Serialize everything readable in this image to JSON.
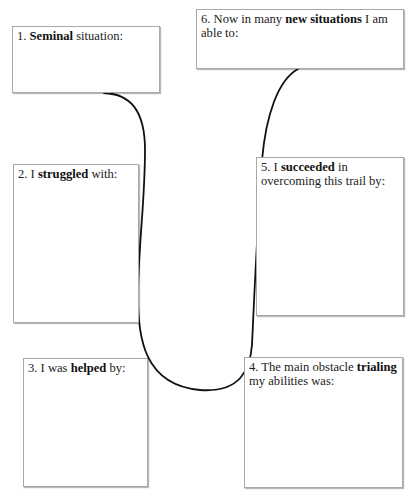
{
  "diagram": {
    "type": "story-arc-worksheet",
    "connector_color": "#111111",
    "box_border_color": "#a8a8a8",
    "boxes": [
      {
        "id": "1",
        "prefix": "1. ",
        "bold": "Seminal",
        "suffix": " situation:"
      },
      {
        "id": "2",
        "prefix": "2. I ",
        "bold": "struggled",
        "suffix": " with:"
      },
      {
        "id": "3",
        "prefix": "3. I was ",
        "bold": "helped",
        "suffix": " by:"
      },
      {
        "id": "4",
        "prefix": "4. The main obstacle ",
        "bold": "trialing",
        "suffix": " my abilities was:"
      },
      {
        "id": "5",
        "prefix": "5. I ",
        "bold": "succeeded",
        "suffix": " in overcoming this trail by:"
      },
      {
        "id": "6",
        "prefix": "6. Now in many ",
        "bold": "new situations",
        "suffix": " I am able to:"
      }
    ]
  }
}
